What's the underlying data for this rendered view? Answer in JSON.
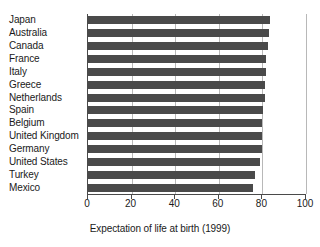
{
  "chart_data": {
    "type": "bar",
    "orientation": "horizontal",
    "title": "",
    "xlabel": "Expectation of life at birth (1999)",
    "ylabel": "",
    "xlim": [
      0,
      100
    ],
    "xticks": [
      0,
      20,
      40,
      60,
      80,
      100
    ],
    "xtick_labels": [
      "0",
      "20",
      "40",
      "60",
      "80",
      "100"
    ],
    "grid": true,
    "grid_axis": "x",
    "legend": false,
    "bar_color": "#4a4a4a",
    "categories": [
      "Japan",
      "Australia",
      "Canada",
      "France",
      "Italy",
      "Greece",
      "Netherlands",
      "Spain",
      "Belgium",
      "United Kingdom",
      "Germany",
      "United States",
      "Turkey",
      "Mexico"
    ],
    "values": [
      83.5,
      83,
      82.5,
      81.5,
      81.5,
      81,
      81,
      80.5,
      80,
      80,
      80,
      79,
      76.5,
      75.5
    ]
  }
}
